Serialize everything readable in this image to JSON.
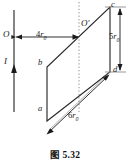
{
  "figure": {
    "caption": "图 5.32",
    "wire": {
      "current_label": "I",
      "origin_label": "O",
      "direction": "upward"
    },
    "axis": {
      "origin_prime_label": "O'",
      "dotted_guide": true
    },
    "vertices": {
      "a": "a",
      "b": "b",
      "c": "c",
      "d": "d"
    },
    "dimensions": [
      {
        "name": "distance-wire-to-Oprime",
        "coefficient": "4",
        "symbol": "r",
        "subscript": "0"
      },
      {
        "name": "side-cd-length",
        "coefficient": "5",
        "symbol": "r",
        "subscript": "0"
      },
      {
        "name": "side-ad-length",
        "coefficient": "6",
        "symbol": "r",
        "subscript": "0"
      }
    ],
    "colors": {
      "line": "#222222",
      "dotted": "#8a8a8a",
      "background": "#ffffff",
      "text": "#1a1a1a"
    }
  }
}
